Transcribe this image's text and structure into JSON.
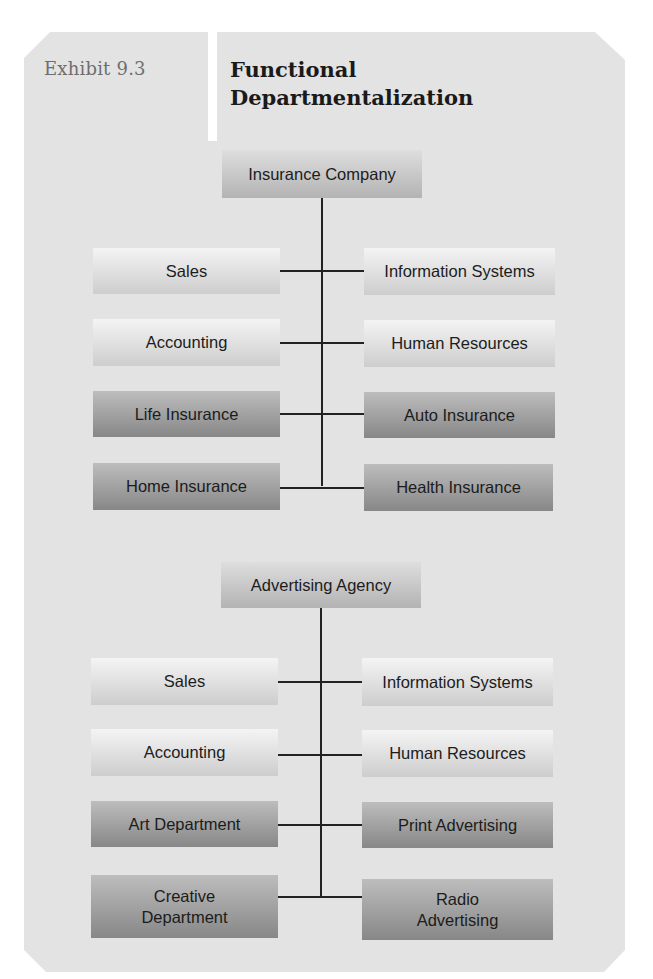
{
  "exhibit": {
    "label": "Exhibit 9.3",
    "title_line1": "Functional",
    "title_line2": "Departmentalization"
  },
  "colors": {
    "panel_background": "#e3e3e3",
    "light_box_gradient": [
      "#f4f4f4",
      "#cdcdcd"
    ],
    "dark_box_gradient": [
      "#bdbdbd",
      "#878787"
    ],
    "head_box_gradient": [
      "#dedede",
      "#b3b3b3"
    ],
    "connector_line": "#222222"
  },
  "charts": [
    {
      "root": "Insurance Company",
      "rows": [
        {
          "left": "Sales",
          "right": "Information Systems",
          "style": "light"
        },
        {
          "left": "Accounting",
          "right": "Human Resources",
          "style": "light"
        },
        {
          "left": "Life Insurance",
          "right": "Auto Insurance",
          "style": "dark"
        },
        {
          "left": "Home Insurance",
          "right": "Health Insurance",
          "style": "dark"
        }
      ]
    },
    {
      "root": "Advertising Agency",
      "rows": [
        {
          "left": "Sales",
          "right": "Information Systems",
          "style": "light"
        },
        {
          "left": "Accounting",
          "right": "Human Resources",
          "style": "light"
        },
        {
          "left": "Art Department",
          "right": "Print Advertising",
          "style": "dark"
        },
        {
          "left_line1": "Creative",
          "left_line2": "Department",
          "right_line1": "Radio",
          "right_line2": "Advertising",
          "style": "dark"
        }
      ]
    }
  ]
}
